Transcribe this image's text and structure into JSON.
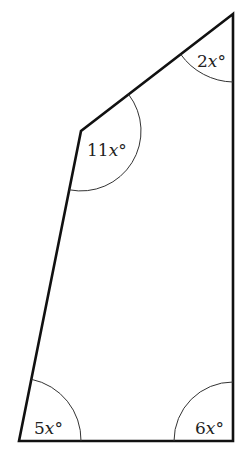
{
  "diagram": {
    "type": "quadrilateral",
    "vertices": {
      "top_right": {
        "x": 233,
        "y": 14
      },
      "upper_left": {
        "x": 81,
        "y": 131
      },
      "bottom_left": {
        "x": 19,
        "y": 441
      },
      "bottom_right": {
        "x": 233,
        "y": 441
      }
    },
    "angles": [
      {
        "vertex": "top_right",
        "coef": "2",
        "var": "x",
        "unit": "°"
      },
      {
        "vertex": "upper_left",
        "coef": "11",
        "var": "x",
        "unit": "°"
      },
      {
        "vertex": "bottom_left",
        "coef": "5",
        "var": "x",
        "unit": "°"
      },
      {
        "vertex": "bottom_right",
        "coef": "6",
        "var": "x",
        "unit": "°"
      }
    ]
  }
}
